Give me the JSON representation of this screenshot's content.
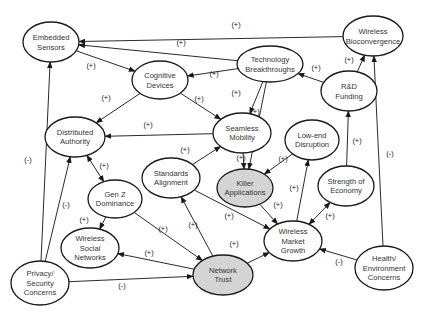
{
  "diagram": {
    "type": "causal-loop",
    "colors": {
      "node_fill": "#ffffff",
      "highlight_fill": "#d4d4d4",
      "stroke": "#1a1a1a",
      "text": "#333333"
    },
    "nodes": [
      {
        "id": "embedded_sensors",
        "lines": [
          "Embedded",
          "Sensors"
        ],
        "cx": 51,
        "cy": 42,
        "rx": 28,
        "ry": 20,
        "highlight": false
      },
      {
        "id": "cognitive_devices",
        "lines": [
          "Cognitive",
          "Devices"
        ],
        "cx": 160,
        "cy": 80,
        "rx": 28,
        "ry": 19,
        "highlight": false
      },
      {
        "id": "technology_breakthroughs",
        "lines": [
          "Technology",
          "Breakthroughs"
        ],
        "cx": 270,
        "cy": 64,
        "rx": 33,
        "ry": 18,
        "highlight": false
      },
      {
        "id": "wireless_bioconvergence",
        "lines": [
          "Wireless",
          "Bioconvergence"
        ],
        "cx": 373,
        "cy": 36,
        "rx": 30,
        "ry": 20,
        "highlight": false
      },
      {
        "id": "rd_funding",
        "lines": [
          "R&D",
          "Funding"
        ],
        "cx": 349,
        "cy": 91,
        "rx": 28,
        "ry": 20,
        "highlight": false
      },
      {
        "id": "distributed_authority",
        "lines": [
          "Distributed",
          "Authority"
        ],
        "cx": 75,
        "cy": 137,
        "rx": 30,
        "ry": 20,
        "highlight": false
      },
      {
        "id": "seamless_mobility",
        "lines": [
          "Seamless",
          "Mobility"
        ],
        "cx": 242,
        "cy": 133,
        "rx": 29,
        "ry": 20,
        "highlight": false
      },
      {
        "id": "low_end_disruption",
        "lines": [
          "Low-end",
          "Disruption"
        ],
        "cx": 312,
        "cy": 140,
        "rx": 27,
        "ry": 20,
        "highlight": false
      },
      {
        "id": "standards_alignment",
        "lines": [
          "Standards",
          "Alignment"
        ],
        "cx": 171,
        "cy": 178,
        "rx": 29,
        "ry": 20,
        "highlight": false
      },
      {
        "id": "killer_applications",
        "lines": [
          "Killer",
          "Applications"
        ],
        "cx": 245,
        "cy": 188,
        "rx": 28,
        "ry": 19,
        "highlight": true
      },
      {
        "id": "strength_of_economy",
        "lines": [
          "Strength of",
          "Economy"
        ],
        "cx": 346,
        "cy": 186,
        "rx": 28,
        "ry": 20,
        "highlight": false
      },
      {
        "id": "gen_z_dominance",
        "lines": [
          "Gen Z",
          "Dominance"
        ],
        "cx": 115,
        "cy": 199,
        "rx": 27,
        "ry": 19,
        "highlight": false
      },
      {
        "id": "wireless_social_networks",
        "lines": [
          "Wireless",
          "Social",
          "Networks"
        ],
        "cx": 90,
        "cy": 248,
        "rx": 29,
        "ry": 20,
        "highlight": false
      },
      {
        "id": "wireless_market_growth",
        "lines": [
          "Wireless",
          "Market",
          "Growth"
        ],
        "cx": 293,
        "cy": 241,
        "rx": 29,
        "ry": 20,
        "highlight": false
      },
      {
        "id": "network_trust",
        "lines": [
          "Network",
          "Trust"
        ],
        "cx": 223,
        "cy": 275,
        "rx": 30,
        "ry": 20,
        "highlight": true
      },
      {
        "id": "privacy_security_concerns",
        "lines": [
          "Privacy/",
          "Security",
          "Concerns"
        ],
        "cx": 40,
        "cy": 283,
        "rx": 29,
        "ry": 22,
        "highlight": false
      },
      {
        "id": "health_environment_concerns",
        "lines": [
          "Health/",
          "Environment",
          "Concerns"
        ],
        "cx": 384,
        "cy": 268,
        "rx": 29,
        "ry": 22,
        "highlight": false
      }
    ],
    "edges": [
      {
        "from": "wireless_bioconvergence",
        "to": "embedded_sensors",
        "sign": "(+)",
        "bidirectional": false,
        "lx": 236,
        "ly": 27
      },
      {
        "from": "technology_breakthroughs",
        "to": "embedded_sensors",
        "sign": "(+)",
        "bidirectional": false,
        "lx": 181,
        "ly": 45
      },
      {
        "from": "embedded_sensors",
        "to": "cognitive_devices",
        "sign": "(+)",
        "bidirectional": false,
        "lx": 91,
        "ly": 68
      },
      {
        "from": "technology_breakthroughs",
        "to": "cognitive_devices",
        "sign": "(+)",
        "bidirectional": false,
        "lx": 214,
        "ly": 76
      },
      {
        "from": "rd_funding",
        "to": "technology_breakthroughs",
        "sign": "(+)",
        "bidirectional": false,
        "lx": 316,
        "ly": 70
      },
      {
        "from": "rd_funding",
        "to": "wireless_bioconvergence",
        "sign": "(+)",
        "bidirectional": false,
        "lx": 349,
        "ly": 62
      },
      {
        "from": "cognitive_devices",
        "to": "distributed_authority",
        "sign": "(+)",
        "bidirectional": false,
        "lx": 106,
        "ly": 100
      },
      {
        "from": "cognitive_devices",
        "to": "seamless_mobility",
        "sign": "(+)",
        "bidirectional": false,
        "lx": 199,
        "ly": 101
      },
      {
        "from": "technology_breakthroughs",
        "to": "seamless_mobility",
        "sign": "(+)",
        "bidirectional": false,
        "lx": 236,
        "ly": 95
      },
      {
        "from": "technology_breakthroughs",
        "to": "killer_applications",
        "sign": "(+)",
        "bidirectional": false,
        "lx": 255,
        "ly": 114
      },
      {
        "from": "seamless_mobility",
        "to": "distributed_authority",
        "sign": "(+)",
        "bidirectional": false,
        "lx": 148,
        "ly": 127
      },
      {
        "from": "standards_alignment",
        "to": "seamless_mobility",
        "sign": "(+)",
        "bidirectional": false,
        "lx": 185,
        "ly": 152
      },
      {
        "from": "seamless_mobility",
        "to": "killer_applications",
        "sign": "(+)",
        "bidirectional": false,
        "lx": 241,
        "ly": 160
      },
      {
        "from": "low_end_disruption",
        "to": "killer_applications",
        "sign": "(+)",
        "bidirectional": false,
        "lx": 283,
        "ly": 161
      },
      {
        "from": "distributed_authority",
        "to": "gen_z_dominance",
        "sign": "(+)",
        "bidirectional": true,
        "lx": 104,
        "ly": 168
      },
      {
        "from": "privacy_security_concerns",
        "to": "distributed_authority",
        "sign": "(-)",
        "bidirectional": false,
        "lx": 66,
        "ly": 207
      },
      {
        "from": "privacy_security_concerns",
        "to": "embedded_sensors",
        "sign": "(-)",
        "bidirectional": false,
        "lx": 28,
        "ly": 162
      },
      {
        "from": "gen_z_dominance",
        "to": "wireless_social_networks",
        "sign": "(+)",
        "bidirectional": false,
        "lx": 84,
        "ly": 222
      },
      {
        "from": "gen_z_dominance",
        "to": "network_trust",
        "sign": "(+)",
        "bidirectional": false,
        "lx": 163,
        "ly": 231
      },
      {
        "from": "network_trust",
        "to": "wireless_social_networks",
        "sign": "(+)",
        "bidirectional": false,
        "lx": 149,
        "ly": 255
      },
      {
        "from": "network_trust",
        "to": "standards_alignment",
        "sign": "(+)",
        "bidirectional": false,
        "lx": 193,
        "ly": 227
      },
      {
        "from": "privacy_security_concerns",
        "to": "network_trust",
        "sign": "(-)",
        "bidirectional": false,
        "lx": 122,
        "ly": 288
      },
      {
        "from": "standards_alignment",
        "to": "wireless_market_growth",
        "sign": "(+)",
        "bidirectional": false,
        "lx": 229,
        "ly": 218
      },
      {
        "from": "killer_applications",
        "to": "wireless_market_growth",
        "sign": "(+)",
        "bidirectional": false,
        "lx": 278,
        "ly": 207
      },
      {
        "from": "network_trust",
        "to": "wireless_market_growth",
        "sign": "(+)",
        "bidirectional": false,
        "lx": 234,
        "ly": 246
      },
      {
        "from": "wireless_market_growth",
        "to": "low_end_disruption",
        "sign": "(+)",
        "bidirectional": false,
        "lx": 294,
        "ly": 190
      },
      {
        "from": "wireless_market_growth",
        "to": "strength_of_economy",
        "sign": "(+)",
        "bidirectional": true,
        "lx": 330,
        "ly": 218
      },
      {
        "from": "strength_of_economy",
        "to": "rd_funding",
        "sign": "(+)",
        "bidirectional": false,
        "lx": 357,
        "ly": 143
      },
      {
        "from": "health_environment_concerns",
        "to": "wireless_market_growth",
        "sign": "(-)",
        "bidirectional": false,
        "lx": 339,
        "ly": 264
      },
      {
        "from": "health_environment_concerns",
        "to": "wireless_bioconvergence",
        "sign": "(-)",
        "bidirectional": false,
        "lx": 390,
        "ly": 156
      }
    ]
  }
}
